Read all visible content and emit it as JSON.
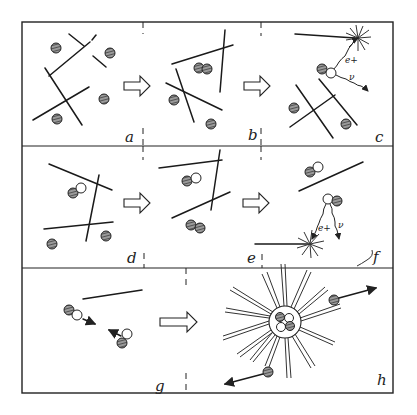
{
  "figure": {
    "panels": [
      {
        "id": "a",
        "label": "a",
        "description": "Scattered hatched particles among crossing line segments"
      },
      {
        "id": "b",
        "label": "b",
        "description": "Two particles approach each other, forming a pair"
      },
      {
        "id": "c",
        "label": "c",
        "description": "Pair emits e+ and neutrino; burst at upper right"
      },
      {
        "id": "d",
        "label": "d",
        "description": "Hatched particle paired with open (hollow) particle"
      },
      {
        "id": "e",
        "label": "e",
        "description": "Pairs moving among lines"
      },
      {
        "id": "f",
        "label": "f",
        "description": "Pair emits e+ and neutrino; burst at lower left"
      },
      {
        "id": "g",
        "label": "g",
        "description": "Two pairs moving toward each other"
      },
      {
        "id": "h",
        "label": "h",
        "description": "Fused cluster of four particles with radiating burst and ejected particles"
      }
    ],
    "annotations": {
      "positron": "e+",
      "neutrino": "ν"
    },
    "colors": {
      "line": "#222222",
      "background": "#ffffff",
      "hatch_fill": "#7a7a7a"
    }
  }
}
